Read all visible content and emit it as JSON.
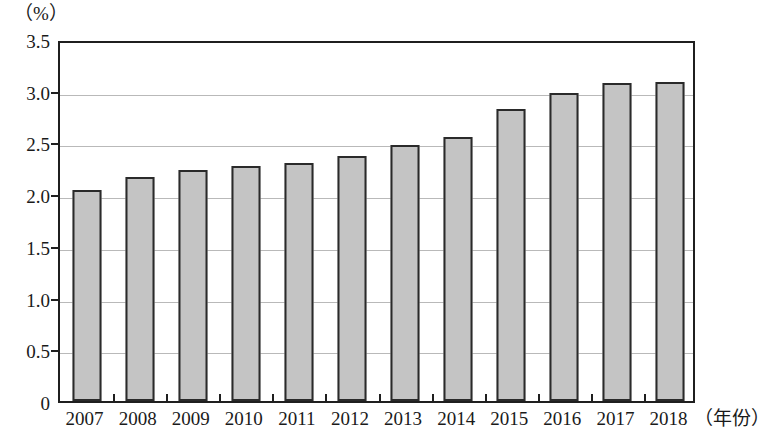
{
  "chart_data": {
    "type": "bar",
    "title": "",
    "subtitle": "",
    "xlabel": "（年份）",
    "ylabel": "（%）",
    "categories": [
      "2007",
      "2008",
      "2009",
      "2010",
      "2011",
      "2012",
      "2013",
      "2014",
      "2015",
      "2016",
      "2017",
      "2018"
    ],
    "values": [
      2.04,
      2.17,
      2.23,
      2.27,
      2.3,
      2.37,
      2.48,
      2.55,
      2.82,
      2.98,
      3.07,
      3.08
    ],
    "ylim": [
      0,
      3.5
    ],
    "ytick_labels": [
      "0",
      "0.5",
      "1.0",
      "1.5",
      "2.0",
      "2.5",
      "3.0",
      "3.5"
    ],
    "ytick_values": [
      0,
      0.5,
      1.0,
      1.5,
      2.0,
      2.5,
      3.0,
      3.5
    ],
    "grid": true,
    "grid_axis": "y",
    "legend": null,
    "legend_position": "none",
    "series": [
      {
        "name": "",
        "values": [
          2.04,
          2.17,
          2.23,
          2.27,
          2.3,
          2.37,
          2.48,
          2.55,
          2.82,
          2.98,
          3.07,
          3.08
        ],
        "bar_fill": "#c4c4c4",
        "bar_stroke": "#2a2a2a"
      }
    ]
  },
  "colors": {
    "bar_fill": "#c4c4c4",
    "bar_stroke": "#2a2a2a",
    "axis": "#1f1f1f",
    "gridline": "#b9b9b9",
    "background": "#ffffff"
  }
}
